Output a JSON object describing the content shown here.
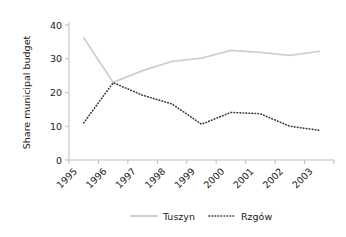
{
  "chart_data": {
    "type": "line",
    "title": "",
    "xlabel": "",
    "ylabel": "Share municipal budget",
    "categories": [
      "1995",
      "1996",
      "1997",
      "1998",
      "1999",
      "2000",
      "2001",
      "2002",
      "2003"
    ],
    "ylim": [
      0,
      40
    ],
    "yticks": [
      0,
      10,
      20,
      30,
      40
    ],
    "ytick_labels": [
      "0",
      "10",
      "20",
      "30",
      "40"
    ],
    "grid": false,
    "legend_position": "bottom",
    "series": [
      {
        "name": "Tuszyn",
        "style": "solid",
        "color": "#cfcfcf",
        "values": [
          36.2,
          23.0,
          26.5,
          29.2,
          30.2,
          32.5,
          31.9,
          31.0,
          32.2
        ]
      },
      {
        "name": "Rzgów",
        "style": "dotted",
        "color": "#3a3a3a",
        "values": [
          11.0,
          22.9,
          19.2,
          16.6,
          10.6,
          14.1,
          13.7,
          10.0,
          8.8
        ]
      }
    ]
  },
  "axis": {
    "y_title": "Share municipal budget"
  },
  "legend": {
    "entries": [
      {
        "label": "Tuszyn",
        "swatch": "solid-line-swatch"
      },
      {
        "label": "Rzgów",
        "swatch": "dotted-line-swatch"
      }
    ]
  }
}
